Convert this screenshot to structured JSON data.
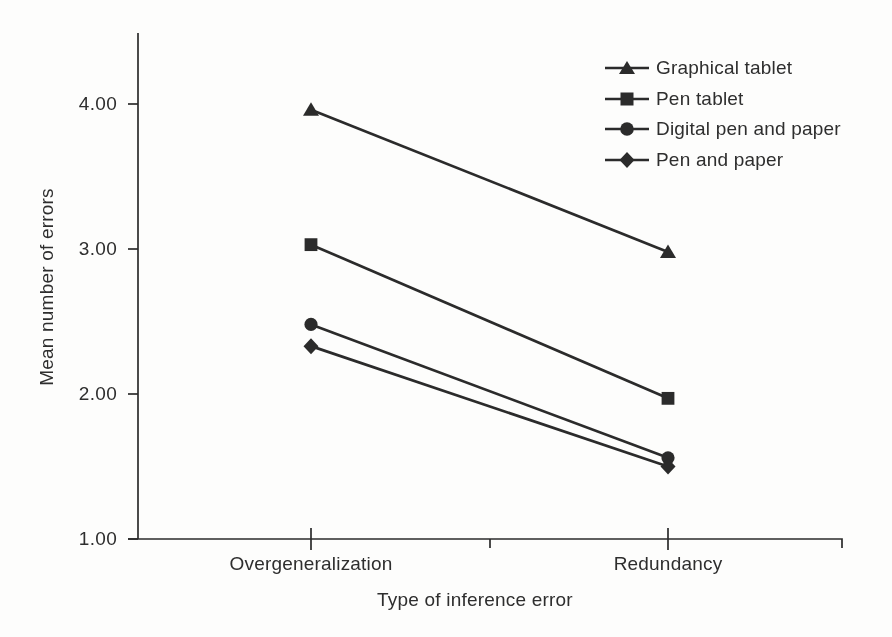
{
  "figure": {
    "background_color": "#fdfdfc",
    "ink_color": "#2b2b2b",
    "text_color": "#2e2e2e"
  },
  "chart_data": {
    "type": "line",
    "title": "",
    "xlabel": "Type of inference error",
    "ylabel": "Mean number of errors",
    "categories": [
      "Overgeneralization",
      "Redundancy"
    ],
    "y_tick_labels": [
      "4.00",
      "3.00",
      "2.00",
      "1.00"
    ],
    "y_tick_values": [
      4.0,
      3.0,
      2.0,
      1.0
    ],
    "ylim": [
      1.0,
      4.5
    ],
    "grid": false,
    "legend_position": "top-right",
    "has_minor_tick_between_categories": true,
    "series": [
      {
        "name": "Graphical tablet",
        "marker": "triangle",
        "values": [
          3.96,
          2.98
        ]
      },
      {
        "name": "Pen tablet",
        "marker": "square",
        "values": [
          3.03,
          1.97
        ]
      },
      {
        "name": "Digital pen and paper",
        "marker": "circle",
        "values": [
          2.48,
          1.56
        ]
      },
      {
        "name": "Pen and paper",
        "marker": "diamond",
        "values": [
          2.33,
          1.5
        ]
      }
    ]
  }
}
